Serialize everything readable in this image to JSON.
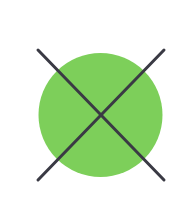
{
  "figure": {
    "icon": "crossed-out-circle-icon",
    "colors": {
      "background": "#ffffff",
      "circle_fill": "#7dcf5a",
      "cross_stroke": "#3a3a44"
    },
    "circle": {
      "cx": 100.5,
      "cy": 115,
      "r": 62
    },
    "cross": {
      "stroke_width": 3,
      "line1": {
        "x1": 38,
        "y1": 50,
        "x2": 164,
        "y2": 180
      },
      "line2": {
        "x1": 164,
        "y1": 50,
        "x2": 38,
        "y2": 180
      }
    }
  }
}
